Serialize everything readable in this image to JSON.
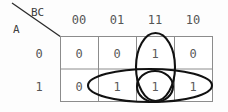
{
  "diagram": {
    "type": "karnaugh-map",
    "corner_labels": {
      "columns_variable": "BC",
      "rows_variable": "A"
    },
    "column_headers": [
      "00",
      "01",
      "11",
      "10"
    ],
    "row_headers": [
      "0",
      "1"
    ],
    "cells": [
      [
        "0",
        "0",
        "1",
        "0"
      ],
      [
        "0",
        "1",
        "1",
        "1"
      ]
    ],
    "groupings": [
      {
        "name": "vertical-group-column-11",
        "shape": "ellipse",
        "covers_cells": [
          "A=0,BC=11",
          "A=1,BC=11"
        ],
        "orientation": "vertical"
      },
      {
        "name": "horizontal-group-row-1",
        "shape": "ellipse",
        "covers_cells": [
          "A=1,BC=01",
          "A=1,BC=11",
          "A=1,BC=10"
        ],
        "orientation": "horizontal"
      },
      {
        "name": "small-group-overlap-cell",
        "shape": "ellipse",
        "covers_cells": [
          "A=1,BC=11"
        ],
        "orientation": "round"
      }
    ],
    "colors": {
      "background": "#fdfdfd",
      "grid_line": "#8c8c8c",
      "grouping_stroke": "#111111",
      "value_text": "#5a5a5a",
      "label_text": "#3d3d3d",
      "divider_line": "#2b2b2b"
    }
  }
}
